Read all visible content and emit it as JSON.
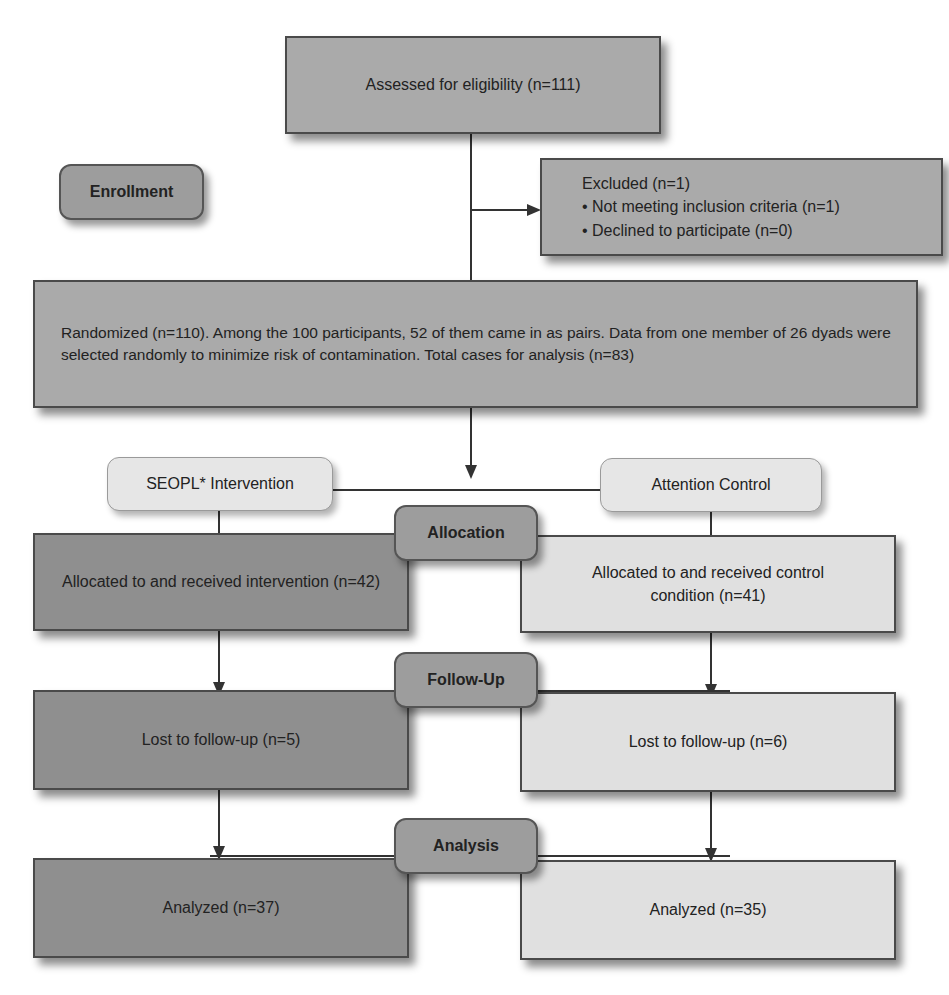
{
  "diagram": {
    "type": "CONSORT flow diagram",
    "stages": {
      "enrollment": "Enrollment",
      "allocation": "Allocation",
      "follow_up": "Follow-Up",
      "analysis": "Analysis"
    },
    "assessed": "Assessed for eligibility (n=111)",
    "excluded": {
      "title": "Excluded (n=1)",
      "items": [
        "Not meeting inclusion criteria (n=1)",
        "Declined to participate (n=0)"
      ]
    },
    "randomized": "Randomized (n=110). Among the 100 participants, 52 of them came in as pairs. Data from one member of 26 dyads were selected randomly to minimize risk of contamination. Total cases for analysis (n=83)",
    "arms": {
      "intervention": {
        "label": "SEOPL* Intervention",
        "allocated": "Allocated to and received intervention (n=42)",
        "lost": "Lost to follow-up (n=5)",
        "analyzed": "Analyzed (n=37)"
      },
      "control": {
        "label": "Attention Control",
        "allocated": "Allocated to and received control condition (n=41)",
        "lost": "Lost to follow-up (n=6)",
        "analyzed": "Analyzed (n=35)"
      }
    }
  },
  "colors": {
    "intervention_fill": "#8f8f8f",
    "control_fill": "#e0e0e0",
    "top_fill": "#aaaaaa",
    "stage_fill": "#9d9d9d",
    "line": "#333333"
  }
}
